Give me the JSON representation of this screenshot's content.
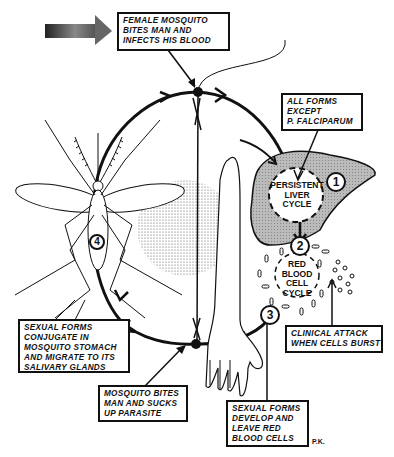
{
  "diagram": {
    "title_arrow": "direction-arrow",
    "callouts": {
      "female_mosquito": [
        "FEMALE MOSQUITO",
        "BITES MAN AND",
        "INFECTS HIS BLOOD"
      ],
      "all_forms": [
        "ALL FORMS",
        "EXCEPT",
        "P. FALCIPARUM"
      ],
      "clinical_attack": [
        "CLINICAL ATTACK",
        "WHEN CELLS BURST"
      ],
      "sexual_conjugate": [
        "SEXUAL FORMS",
        "CONJUGATE IN",
        "MOSQUITO STOMACH",
        "AND MIGRATE TO ITS",
        "SALIVARY GLANDS"
      ],
      "mosquito_bites": [
        "MOSQUITO BITES",
        "MAN AND SUCKS",
        "UP PARASITE"
      ],
      "sexual_develop": [
        "SEXUAL FORMS",
        "DEVELOP AND",
        "LEAVE RED",
        "BLOOD CELLS"
      ]
    },
    "cycles": {
      "liver": [
        "PERSISTENT",
        "LIVER",
        "CYCLE"
      ],
      "red_blood": [
        "RED",
        "BLOOD",
        "CELL",
        "CYCLE"
      ]
    },
    "steps": [
      "1",
      "2",
      "3",
      "4"
    ],
    "signature": "P.K."
  }
}
